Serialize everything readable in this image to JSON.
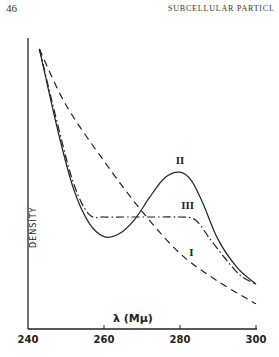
{
  "page": {
    "page_number": "46",
    "running_head": "SUBCELLULAR PARTICL"
  },
  "chart_data": {
    "type": "line",
    "title": "",
    "xlabel": "λ (Mμ)",
    "ylabel": "DENSITY",
    "xlim": [
      240,
      300
    ],
    "ylim": [
      0,
      100
    ],
    "xticks": [
      240,
      260,
      280,
      300
    ],
    "xtick_labels": [
      "240",
      "260",
      "280",
      "300"
    ],
    "yticks": [],
    "grid": false,
    "legend": "inline labels on curves",
    "series": [
      {
        "name": "I",
        "style": "dashed",
        "x": [
          243,
          250,
          260,
          270,
          280,
          290,
          300
        ],
        "y": [
          100,
          80,
          60,
          42,
          27,
          17,
          9
        ]
      },
      {
        "name": "II",
        "style": "solid",
        "x": [
          243,
          248,
          252,
          256,
          260,
          264,
          268,
          272,
          276,
          280,
          283,
          286,
          290,
          295,
          300
        ],
        "y": [
          100,
          70,
          50,
          38,
          33,
          34,
          39,
          47,
          54,
          56,
          53,
          45,
          32,
          22,
          16
        ]
      },
      {
        "name": "III",
        "style": "dash-dot",
        "x": [
          243,
          248,
          252,
          256,
          260,
          265,
          270,
          275,
          280,
          284,
          288,
          292,
          296,
          300
        ],
        "y": [
          100,
          72,
          52,
          41,
          40,
          40,
          40,
          40,
          40,
          39,
          32,
          25,
          19,
          16
        ]
      }
    ],
    "annotations": [
      {
        "text": "I",
        "x": 283,
        "y": 26
      },
      {
        "text": "II",
        "x": 280,
        "y": 59
      },
      {
        "text": "III",
        "x": 282,
        "y": 43
      }
    ]
  }
}
